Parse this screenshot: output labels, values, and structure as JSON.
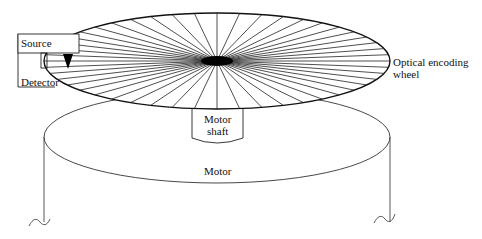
{
  "diagram": {
    "labels": {
      "source": "Source",
      "detector": "Detector",
      "wheel_line1": "Optical encoding",
      "wheel_line2": "wheel",
      "shaft_line1": "Motor",
      "shaft_line2": "shaft",
      "motor": "Motor"
    },
    "wheel": {
      "cx": 217,
      "cy": 61,
      "rx": 173,
      "ry": 48,
      "spokes": 48,
      "hub_rx": 16,
      "hub_ry": 5
    },
    "motor": {
      "cx": 217,
      "cy": 137,
      "rx": 173,
      "ry": 46,
      "bottom_y": 222
    },
    "colors": {
      "stroke": "#111111",
      "fill": "#ffffff"
    }
  }
}
